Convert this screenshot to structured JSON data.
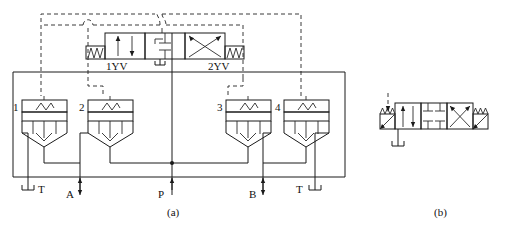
{
  "figure": {
    "background_color": "#ffffff",
    "line_color": "#1a1a1a",
    "dashed_line_color": "#3a3a3a"
  },
  "panels": [
    {
      "id": "a",
      "caption": "(a)"
    },
    {
      "id": "b",
      "caption": "(b)"
    }
  ],
  "panel_a": {
    "main_valve": {
      "name": "three-position four-way solenoid directional valve",
      "positions": 3,
      "solenoid_left_label": "1YV",
      "solenoid_right_label": "2YV"
    },
    "relief_valves": [
      {
        "label": "1",
        "name": "pressure-relief-valve-1"
      },
      {
        "label": "2",
        "name": "pressure-relief-valve-2"
      },
      {
        "label": "3",
        "name": "pressure-relief-valve-3"
      },
      {
        "label": "4",
        "name": "pressure-relief-valve-4"
      }
    ],
    "ports": [
      {
        "label": "T",
        "name": "tank-port-left",
        "x": 28
      },
      {
        "label": "A",
        "name": "port-a",
        "x": 80
      },
      {
        "label": "P",
        "name": "port-p",
        "x": 172
      },
      {
        "label": "B",
        "name": "port-b",
        "x": 263
      },
      {
        "label": "T",
        "name": "tank-port-right",
        "x": 315
      }
    ]
  },
  "panel_b": {
    "valve": {
      "name": "three-position four-way solenoid directional valve with spring centering",
      "positions": 3
    }
  }
}
